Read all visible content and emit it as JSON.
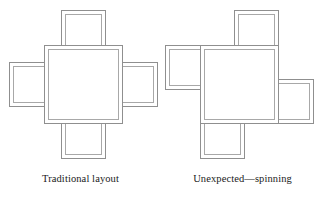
{
  "canvas": {
    "width": 323,
    "height": 199,
    "background": "#ffffff",
    "line_color_outer": "#8f8f8f",
    "line_color_inner": "#a8a8a8",
    "text_color": "#1a1a1a"
  },
  "figures": [
    {
      "id": "traditional",
      "caption": "Traditional layout",
      "arrangement": "symmetric-cross",
      "panels": [
        {
          "role": "center",
          "name": "center-panel",
          "x": 44,
          "y": 45,
          "w": 79,
          "h": 79
        },
        {
          "role": "satellite",
          "name": "top-panel",
          "x": 61,
          "y": 10,
          "w": 45,
          "h": 45
        },
        {
          "role": "satellite",
          "name": "right-panel",
          "x": 113,
          "y": 62,
          "w": 45,
          "h": 45
        },
        {
          "role": "satellite",
          "name": "bottom-panel",
          "x": 61,
          "y": 114,
          "w": 45,
          "h": 45
        },
        {
          "role": "satellite",
          "name": "left-panel",
          "x": 9,
          "y": 62,
          "w": 45,
          "h": 45
        }
      ]
    },
    {
      "id": "spinning",
      "caption": "Unexpected—spinning",
      "arrangement": "pinwheel-spinning",
      "panels": [
        {
          "role": "center",
          "name": "center-panel",
          "x": 38,
          "y": 45,
          "w": 79,
          "h": 79
        },
        {
          "role": "satellite",
          "name": "top-panel",
          "x": 72,
          "y": 10,
          "w": 45,
          "h": 45
        },
        {
          "role": "satellite",
          "name": "right-panel",
          "x": 107,
          "y": 79,
          "w": 45,
          "h": 45
        },
        {
          "role": "satellite",
          "name": "bottom-panel",
          "x": 38,
          "y": 114,
          "w": 45,
          "h": 45
        },
        {
          "role": "satellite",
          "name": "left-panel",
          "x": 3,
          "y": 45,
          "w": 45,
          "h": 45
        }
      ]
    }
  ]
}
